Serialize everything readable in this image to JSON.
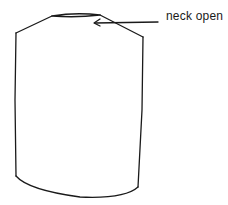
{
  "diagram": {
    "stroke_color": "#1a1a1a",
    "background_color": "#ffffff",
    "annotations": [
      {
        "label": "neck open",
        "points_to": "neck opening"
      }
    ]
  }
}
